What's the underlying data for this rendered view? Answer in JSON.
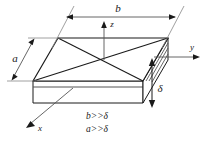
{
  "figure": {
    "background_color": "#ffffff",
    "line_color": "#1a1a1a",
    "dimension_line_color": "#555555",
    "face_fill": "#ffffff"
  },
  "dimensions": {
    "width_label": "b",
    "depth_label": "a",
    "thickness_label": "δ"
  },
  "axes": {
    "x_label": "x",
    "y_label": "y",
    "z_label": "z"
  },
  "notes": [
    "b>>δ",
    "a>>δ"
  ]
}
